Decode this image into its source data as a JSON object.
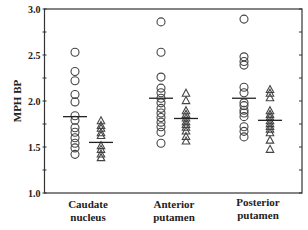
{
  "chart_data": {
    "type": "scatter",
    "title": "",
    "xlabel": "",
    "ylabel": "MPH BP",
    "ylim": [
      1.0,
      3.0
    ],
    "yticks": [
      "1.0",
      "1.5",
      "2.0",
      "2.5",
      "3.0"
    ],
    "grid": false,
    "legend": null,
    "categories": [
      "Caudate nucleus",
      "Anterior putamen",
      "Posterior putamen"
    ],
    "category_lines": [
      [
        "Caudate",
        "nucleus"
      ],
      [
        "Anterior",
        "putamen"
      ],
      [
        "Posterior",
        "putamen"
      ]
    ],
    "series": [
      {
        "name": "circles",
        "marker": "circle",
        "groups": [
          {
            "category": "Caudate nucleus",
            "values": [
              2.53,
              2.32,
              2.22,
              2.07,
              1.99,
              1.84,
              1.79,
              1.71,
              1.66,
              1.6,
              1.54,
              1.49,
              1.42
            ],
            "mean": 1.83
          },
          {
            "category": "Anterior putamen",
            "values": [
              2.86,
              2.53,
              2.26,
              2.14,
              2.09,
              2.03,
              1.98,
              1.92,
              1.87,
              1.82,
              1.77,
              1.72,
              1.66,
              1.54
            ],
            "mean": 2.03
          },
          {
            "category": "Posterior putamen",
            "values": [
              2.89,
              2.48,
              2.43,
              2.39,
              2.15,
              2.09,
              1.98,
              1.95,
              1.9,
              1.87,
              1.83,
              1.72,
              1.67,
              1.61
            ],
            "mean": 2.03
          }
        ]
      },
      {
        "name": "triangles",
        "marker": "triangle",
        "groups": [
          {
            "category": "Caudate nucleus",
            "values": [
              1.79,
              1.74,
              1.71,
              1.66,
              1.63,
              1.52,
              1.48,
              1.43,
              1.39
            ],
            "mean": 1.55
          },
          {
            "category": "Anterior putamen",
            "values": [
              2.09,
              2.01,
              1.9,
              1.86,
              1.82,
              1.78,
              1.75,
              1.72,
              1.68,
              1.62,
              1.57
            ],
            "mean": 1.81
          },
          {
            "category": "Posterior putamen",
            "values": [
              2.13,
              2.09,
              2.04,
              1.9,
              1.86,
              1.83,
              1.79,
              1.76,
              1.73,
              1.7,
              1.66,
              1.58,
              1.48
            ],
            "mean": 1.79
          }
        ]
      }
    ]
  }
}
